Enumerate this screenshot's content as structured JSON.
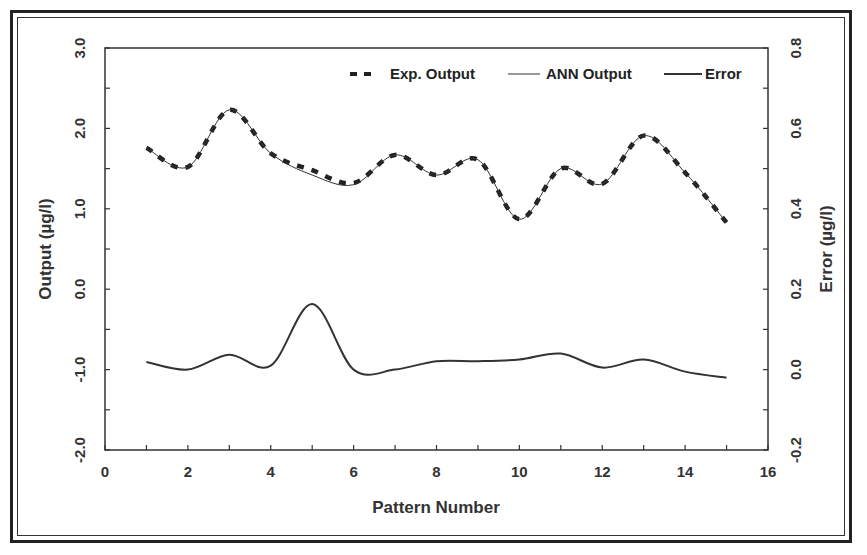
{
  "chart_data": {
    "type": "line",
    "title": "",
    "xlabel": "Pattern Number",
    "ylabel": "Output (µg/l)",
    "y2label": "Error (µg/l)",
    "xlim": [
      0,
      16
    ],
    "ylim": [
      -2.0,
      3.0
    ],
    "y2lim": [
      -0.2,
      0.8
    ],
    "x_ticks": [
      "0",
      "2",
      "4",
      "6",
      "8",
      "10",
      "12",
      "14",
      "16"
    ],
    "y_ticks": [
      "-2.0",
      "-1.0",
      "0.0",
      "1.0",
      "2.0",
      "3.0"
    ],
    "y2_ticks": [
      "-0.2",
      "0.0",
      "0.2",
      "0.4",
      "0.6",
      "0.8"
    ],
    "grid": false,
    "legend_position": "top-right",
    "x": [
      1,
      2,
      3,
      4,
      5,
      6,
      7,
      8,
      9,
      10,
      11,
      12,
      13,
      14,
      15
    ],
    "series": [
      {
        "name": "Exp. Output",
        "axis": "left",
        "style": "dashed-thick",
        "values": [
          1.76,
          1.52,
          2.23,
          1.69,
          1.48,
          1.32,
          1.67,
          1.42,
          1.61,
          0.87,
          1.5,
          1.31,
          1.91,
          1.45,
          0.83
        ]
      },
      {
        "name": "ANN Output",
        "axis": "left",
        "style": "thin-solid",
        "values": [
          1.76,
          1.52,
          2.23,
          1.69,
          1.42,
          1.3,
          1.67,
          1.42,
          1.61,
          0.87,
          1.5,
          1.31,
          1.91,
          1.45,
          0.83
        ]
      },
      {
        "name": "Error",
        "axis": "right",
        "style": "solid",
        "values": [
          0.019,
          0.0,
          0.037,
          0.01,
          0.163,
          0.0,
          0.0,
          0.021,
          0.021,
          0.025,
          0.04,
          0.005,
          0.025,
          -0.005,
          -0.02
        ]
      }
    ]
  },
  "legend": {
    "exp_label": "Exp. Output",
    "ann_label": "ANN Output",
    "error_label": "Error"
  },
  "axes": {
    "x_title": "Pattern Number",
    "y_left_title": "Output (µg/l)",
    "y_right_title": "Error (µg/l)"
  },
  "colors": {
    "line": "#333333",
    "axis": "#333333",
    "background": "#ffffff"
  }
}
